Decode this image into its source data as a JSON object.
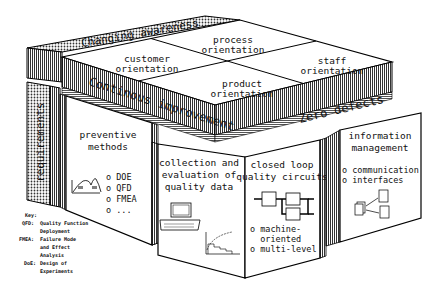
{
  "diagram": {
    "roof": {
      "back_band": "Changing awareness",
      "front_band": "Continous improvement",
      "right_band": "Zero defects",
      "quadrants": {
        "top": [
          "process",
          "orientation"
        ],
        "left": [
          "customer",
          "orientation"
        ],
        "right": [
          "staff",
          "orientation"
        ],
        "bottom": [
          "product",
          "orientation"
        ]
      }
    },
    "left_pillar": "requirements",
    "pillars": [
      {
        "title": [
          "preventive",
          "methods"
        ],
        "items": [
          "o DOE",
          "o QFD",
          "o FMEA",
          "o ..."
        ],
        "icon": "distribution-curve-icon"
      },
      {
        "title": [
          "collection and",
          "evaluation of",
          "quality data"
        ],
        "items": [],
        "icon": "computer-and-chart-icon"
      },
      {
        "title": [
          "closed loop",
          "quality circuits"
        ],
        "items": [
          "o machine-",
          "  oriented",
          "o multi-level"
        ],
        "icon": "feedback-loop-icon"
      },
      {
        "title": [
          "information",
          "management"
        ],
        "items": [
          "o communication",
          "o interfaces"
        ],
        "icon": "interface-diagram-icon"
      }
    ],
    "key": {
      "heading": "Key:",
      "entries": [
        {
          "abbr": "QFD:",
          "lines": [
            "Quality Function",
            "Deployment"
          ]
        },
        {
          "abbr": "FMEA:",
          "lines": [
            "Failure Mode",
            "and Effect",
            "Analysis"
          ]
        },
        {
          "abbr": "DoE:",
          "lines": [
            "Design of",
            "Experiments"
          ]
        }
      ]
    }
  }
}
